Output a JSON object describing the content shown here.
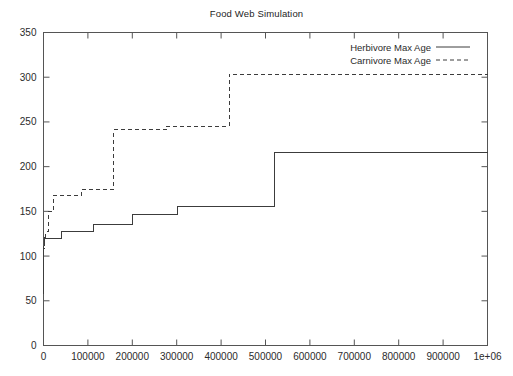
{
  "chart_data": {
    "type": "line",
    "title": "Food Web Simulation",
    "xlabel": "",
    "ylabel": "",
    "xlim": [
      0,
      1000000
    ],
    "ylim": [
      0,
      350
    ],
    "grid": false,
    "legend_position": "top-right",
    "x_tick_labels": [
      "0",
      "100000",
      "200000",
      "300000",
      "400000",
      "500000",
      "600000",
      "700000",
      "800000",
      "900000",
      "1e+06"
    ],
    "x_tick_values": [
      0,
      100000,
      200000,
      300000,
      400000,
      500000,
      600000,
      700000,
      800000,
      900000,
      1000000
    ],
    "y_tick_labels": [
      "0",
      "50",
      "100",
      "150",
      "200",
      "250",
      "300",
      "350"
    ],
    "y_tick_values": [
      0,
      50,
      100,
      150,
      200,
      250,
      300,
      350
    ],
    "series": [
      {
        "name": "Herbivore Max Age",
        "style": "solid",
        "color": "#3c3c3c",
        "x": [
          0,
          600,
          1200,
          2000,
          4000,
          40000,
          40000,
          113000,
          113000,
          200000,
          200000,
          302000,
          302000,
          520000,
          520000,
          1000000
        ],
        "y": [
          58,
          92,
          112,
          119,
          120,
          120,
          128,
          128,
          135,
          135,
          147,
          147,
          155,
          155,
          216,
          216
        ]
      },
      {
        "name": "Carnivore Max Age",
        "style": "dashed",
        "color": "#3c3c3c",
        "x": [
          0,
          600,
          1500,
          3000,
          7000,
          12000,
          12000,
          22000,
          22000,
          85000,
          85000,
          158000,
          158000,
          278000,
          278000,
          418000,
          418000,
          1000000
        ],
        "y": [
          58,
          95,
          115,
          120,
          128,
          128,
          150,
          150,
          168,
          168,
          175,
          175,
          241,
          241,
          245,
          245,
          303,
          303
        ]
      }
    ]
  },
  "legend": {
    "entries": [
      {
        "label": "Herbivore Max Age",
        "style": "solid"
      },
      {
        "label": "Carnivore Max Age",
        "style": "dashed"
      }
    ]
  },
  "colors": {
    "background": "#ffffff",
    "axis": "#555555",
    "text": "#2b2b2b",
    "line": "#3c3c3c"
  }
}
